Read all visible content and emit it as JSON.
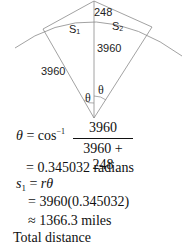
{
  "diagram": {
    "labels": {
      "height": "248",
      "arc_left": "S",
      "arc_left_sub": "1",
      "arc_right": "S",
      "arc_right_sub": "2",
      "radius_center": "3960",
      "radius_left": "3960",
      "angle_left": "θ",
      "angle_right": "θ"
    },
    "colors": {
      "line": "#8a8a8a",
      "text": "#111111"
    }
  },
  "solution": {
    "line1_lhs": "θ",
    "line1_eq": " = cos",
    "line1_sup": "−1",
    "fraction_num": "3960",
    "fraction_den": "3960 + 248",
    "line2": "= 0.345032 radians",
    "line3_s": "s",
    "line3_sub": "1",
    "line3_eq": " = ",
    "line3_r": "r",
    "line3_theta": "θ",
    "line4": "= 3960(0.345032)",
    "line5": "≈ 1366.3 miles",
    "line6": "Total distance"
  }
}
